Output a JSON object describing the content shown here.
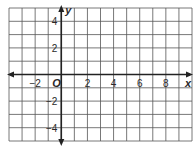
{
  "diagram": {
    "type": "coordinate-plane",
    "x_axis": {
      "label": "x",
      "min": -4,
      "max": 10,
      "tick_labels": [
        "−2",
        "2",
        "4",
        "6",
        "8"
      ],
      "tick_values": [
        -2,
        2,
        4,
        6,
        8
      ]
    },
    "y_axis": {
      "label": "y",
      "min": -5,
      "max": 5,
      "tick_labels": [
        "4",
        "2",
        "−2",
        "−4"
      ],
      "tick_values": [
        4,
        2,
        -2,
        -4
      ]
    },
    "origin_label": "O",
    "grid": {
      "step": 1,
      "visible": true
    },
    "colors": {
      "grid": "#555555",
      "axis": "#222222",
      "background": "#ffffff",
      "text": "#2a2a2a"
    }
  }
}
